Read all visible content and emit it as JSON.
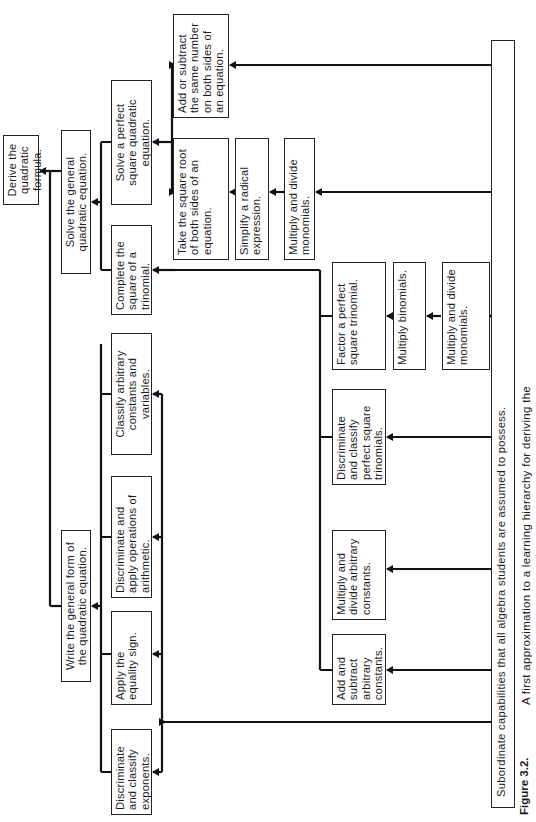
{
  "figure": {
    "label": "Figure 3.2.",
    "caption": "A first approximation to a learning hierarchy for deriving the",
    "orientation": "rotated 90 degrees counter-clockwise"
  },
  "nodes": {
    "derive": "Derive the quadratic formula.",
    "write_general": "Write the general form of the quadratic equation.",
    "solve_general": "Solve the general quadratic equation.",
    "complete_square": "Complete the square of a trinomial.",
    "solve_perfect": "Solve a perfect square quadratic equation.",
    "add_subtract_number": "Add or subtract the same number on both sides of an equation.",
    "take_square_root": "Take the square root of both sides of an equation.",
    "simplify_radical": "Simplify a radical expression.",
    "multiply_monomials_a": "Multiply and divide monomials.",
    "classify_constants": "Classify arbitrary constants and variables.",
    "discriminate_arithmetic": "Discriminate and apply operations of arithmetic.",
    "apply_equality": "Apply the equality sign.",
    "discriminate_exponents": "Discriminate and classify exponents.",
    "factor_trinomial": "Factor a perfect square trinomial.",
    "multiply_binomials": "Multiply binomials.",
    "multiply_monomials_b": "Multiply and divide monomials.",
    "discriminate_trinomials": "Discriminate and classify perfect square trinomials.",
    "multiply_constants": "Multiply and divide arbitrary constants.",
    "add_constants": "Add and subtract arbitrary constants.",
    "subordinate": "Subordinate capabilities that all algebra students are assumed to possess."
  }
}
